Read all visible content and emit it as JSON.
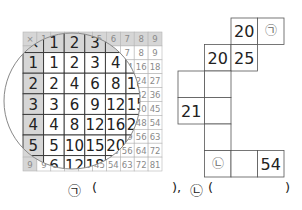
{
  "multiplication_table": {
    "operator": "×",
    "size": 9,
    "magnified_rows": 4,
    "magnified_cols": 4,
    "highlight_color": "#d6d6d6",
    "faint_text_color": "#8a8a8a"
  },
  "puzzle": {
    "cells": [
      {
        "id": "r0c2",
        "value": "20"
      },
      {
        "id": "r0c3",
        "value": "㉠"
      },
      {
        "id": "r1c1",
        "value": "20"
      },
      {
        "id": "r1c2",
        "value": "25"
      },
      {
        "id": "r2c0",
        "value": ""
      },
      {
        "id": "r2c1",
        "value": ""
      },
      {
        "id": "r3c0",
        "value": "21"
      },
      {
        "id": "r3c1",
        "value": ""
      },
      {
        "id": "r4c1",
        "value": ""
      },
      {
        "id": "r5c1",
        "value": "㉡"
      },
      {
        "id": "r5c2",
        "value": ""
      },
      {
        "id": "r5c3",
        "value": "54"
      }
    ]
  },
  "answer": {
    "label_a": "㉠",
    "open_a": "(",
    "close_a": "),",
    "label_b": "㉡",
    "open_b": "(",
    "close_b": ")"
  }
}
